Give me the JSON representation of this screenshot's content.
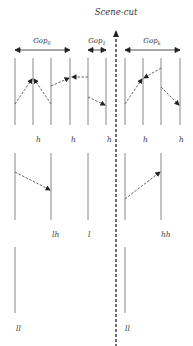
{
  "title": "Scene-cut",
  "gop_labels": {
    "gop0": "Gop",
    "gop0_sub": "0",
    "gop1": "Gop",
    "gop1_sub": "1",
    "gop2": "Gop",
    "gop2_sub": "k"
  },
  "row1_labels": [
    "h",
    "h",
    "h",
    "h",
    "h"
  ],
  "row2_labels": [
    "lh",
    "l",
    "hh"
  ],
  "row3_labels": [
    "ll",
    "ll"
  ],
  "colors": {
    "line": "#888888",
    "arrow": "#222222",
    "dashed": "#333333"
  }
}
